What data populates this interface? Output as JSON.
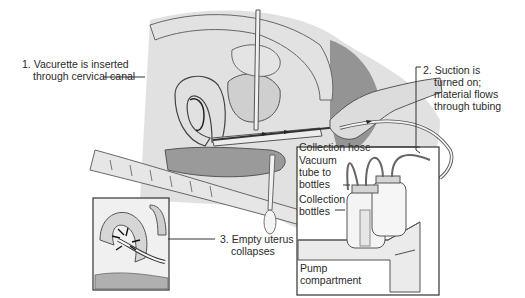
{
  "diagram": {
    "type": "medical-procedure-illustration",
    "labels": {
      "step1": {
        "line1": "1. Vacurette is inserted",
        "line2": "through cervical canal"
      },
      "step2": {
        "line1": "2. Suction is",
        "line2": "turned on;",
        "line3": "material flows",
        "line4": "through tubing"
      },
      "step3": {
        "line1": "3. Empty uterus",
        "line2": "collapses"
      },
      "collection_hose": "Collection hose",
      "vacuum_tube": {
        "line1": "Vacuum",
        "line2": "tube to",
        "line3": "bottles"
      },
      "collection_bottles": {
        "line1": "Collection",
        "line2": "bottles"
      },
      "pump": {
        "line1": "Pump",
        "line2": "compartment"
      }
    },
    "colors": {
      "ink": "#2a2a2a",
      "tissue": "#d8d8d8",
      "tissue_dark": "#a8a8a8",
      "shadow": "#6a6a6a",
      "background": "#ffffff"
    }
  }
}
